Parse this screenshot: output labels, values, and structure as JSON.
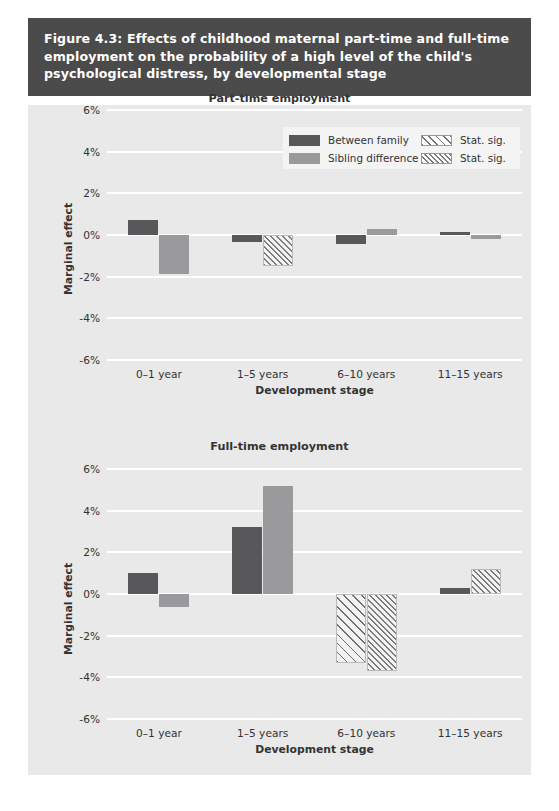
{
  "figure": {
    "title_lines": [
      "Figure 4.3: Effects of childhood maternal part-time and full-time",
      "employment on the probability of a high level of the child's",
      "psychological distress, by developmental stage"
    ],
    "title_bar_color": "#4b4b4b",
    "panel_color": "#e9e9e9"
  },
  "legend": {
    "entries": [
      {
        "label": "Between family",
        "style": "dark",
        "color": "#58585a"
      },
      {
        "label": "Stat. sig.",
        "style": "hatch-dark",
        "color": "#6e6e70"
      },
      {
        "label": "Sibling difference",
        "style": "mid",
        "color": "#9a9a9c"
      },
      {
        "label": "Stat. sig.",
        "style": "hatch-mid",
        "color": "#7c7c7e"
      }
    ]
  },
  "axis": {
    "yticks": [
      "6%",
      "4%",
      "2%",
      "0%",
      "-2%",
      "-4%",
      "-6%"
    ],
    "ylabel": "Marginal effect",
    "xlabel": "Development stage",
    "categories": [
      "0–1 year",
      "1–5 years",
      "6–10 years",
      "11–15 years"
    ]
  },
  "chart_data": [
    {
      "type": "bar",
      "title": "Part-time employment",
      "xlabel": "Development stage",
      "ylabel": "Marginal effect",
      "ylim": [
        -6,
        6
      ],
      "ytick_values": [
        6,
        4,
        2,
        0,
        -2,
        -4,
        -6
      ],
      "grid": true,
      "legend_position": "top-right",
      "categories": [
        "0–1 year",
        "1–5 years",
        "6–10 years",
        "11–15 years"
      ],
      "series": [
        {
          "name": "Between family",
          "color": "#58585a",
          "values": [
            0.7,
            -0.35,
            -0.45,
            0.15
          ],
          "significant": [
            false,
            false,
            false,
            false
          ]
        },
        {
          "name": "Sibling difference",
          "color": "#9a9a9c",
          "values": [
            -1.85,
            -1.5,
            0.3,
            -0.2
          ],
          "significant": [
            false,
            true,
            false,
            false
          ]
        }
      ]
    },
    {
      "type": "bar",
      "title": "Full-time employment",
      "xlabel": "Development stage",
      "ylabel": "Marginal effect",
      "ylim": [
        -6,
        6
      ],
      "ytick_values": [
        6,
        4,
        2,
        0,
        -2,
        -4,
        -6
      ],
      "grid": true,
      "legend_position": "none",
      "categories": [
        "0–1 year",
        "1–5 years",
        "6–10 years",
        "11–15 years"
      ],
      "series": [
        {
          "name": "Between family",
          "color": "#58585a",
          "values": [
            1.0,
            3.2,
            -3.3,
            0.3
          ],
          "significant": [
            false,
            false,
            true,
            false
          ]
        },
        {
          "name": "Sibling difference",
          "color": "#9a9a9c",
          "values": [
            -0.6,
            5.2,
            -3.7,
            1.2
          ],
          "significant": [
            false,
            false,
            true,
            true
          ]
        }
      ]
    }
  ]
}
